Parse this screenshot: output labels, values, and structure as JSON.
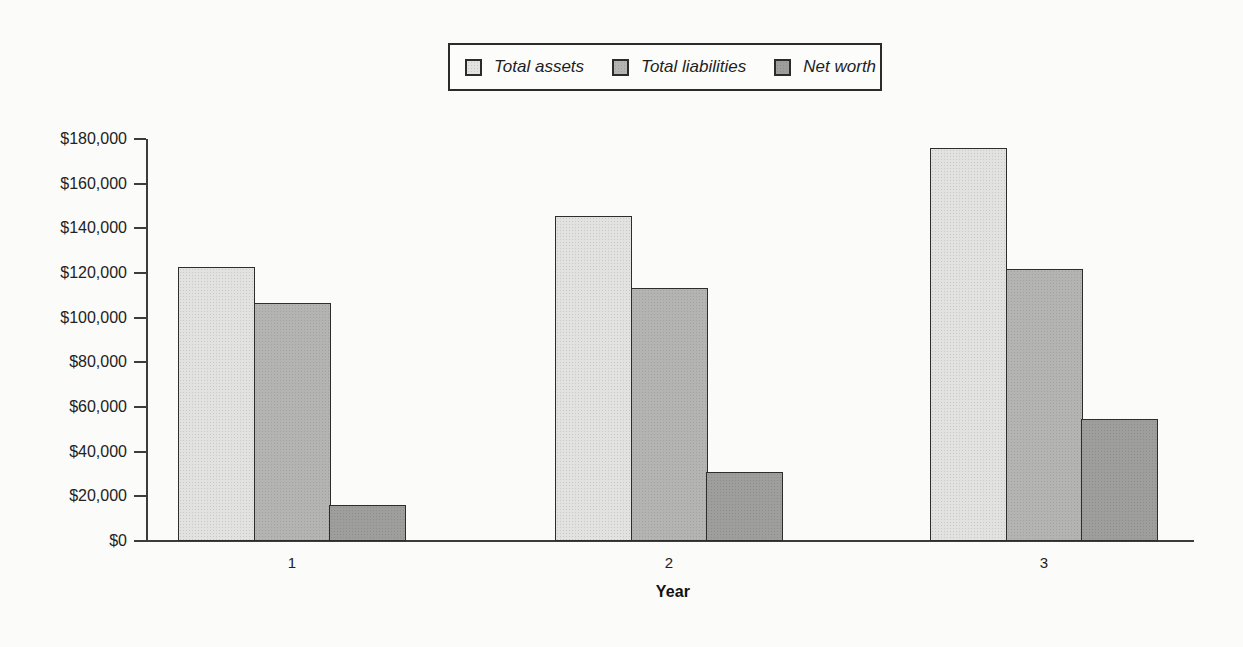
{
  "chart_data": {
    "type": "bar",
    "title": "",
    "xlabel": "Year",
    "ylabel": "",
    "categories": [
      "1",
      "2",
      "3"
    ],
    "series": [
      {
        "name": "Total assets",
        "color": "#e2e2e0",
        "values": [
          122500,
          145500,
          176000
        ]
      },
      {
        "name": "Total liabilities",
        "color": "#b4b4b2",
        "values": [
          106500,
          113500,
          122000
        ]
      },
      {
        "name": "Net worth",
        "color": "#9e9e9c",
        "values": [
          16000,
          31000,
          54500
        ]
      }
    ],
    "ylim": [
      0,
      180000
    ],
    "ytick_step": 20000,
    "ytick_labels": [
      "$0",
      "$20,000",
      "$40,000",
      "$60,000",
      "$80,000",
      "$100,000",
      "$120,000",
      "$140,000",
      "$160,000",
      "$180,000"
    ],
    "legend_position": "top-center",
    "grid": false,
    "axis_color": "#3c3c3c",
    "border_color": "#2d2d2d"
  }
}
